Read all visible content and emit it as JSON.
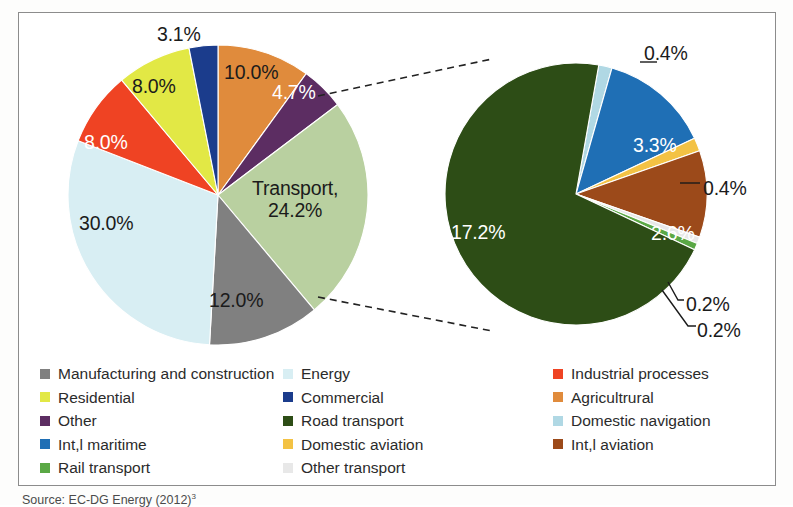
{
  "figure": {
    "source_note": "Source: EC-DG Energy (2012)",
    "source_superscript": "3"
  },
  "colors": {
    "manufacturing": "#808080",
    "energy": "#d8eef3",
    "industrial_processes": "#ef4323",
    "residential": "#e2e845",
    "commercial": "#1b3c8c",
    "agricultrural": "#e08b3c",
    "other": "#5c2d62",
    "road_transport": "#2d4d16",
    "domestic_navigation": "#b0d8e4",
    "intl_maritime": "#1f6fb5",
    "domestic_aviation": "#f3c244",
    "intl_aviation": "#9c4a1a",
    "rail_transport": "#5aa845",
    "other_transport": "#e8e8e8",
    "transport_slice": "#b9d0a0",
    "frame": "#8c8c8c",
    "label_dark": "#1b1b1b",
    "label_light": "#ffffff"
  },
  "chart_data": [
    {
      "type": "pie",
      "name": "total-emissions-pie",
      "title": "",
      "center": [
        218,
        195
      ],
      "radius": 150,
      "start_angle_deg": -90,
      "categories": [
        "Agricultrural",
        "Other",
        "Transport",
        "Manufacturing and construction",
        "Energy",
        "Industrial processes",
        "Residential",
        "Commercial"
      ],
      "values": [
        10.0,
        4.7,
        24.2,
        12.0,
        30.0,
        8.0,
        8.0,
        3.1
      ],
      "labels": [
        "10.0%",
        "4.7%",
        "Transport, 24.2%",
        "12.0%",
        "30.0%",
        "8.0%",
        "8.0%",
        "3.1%"
      ],
      "slice_colors": [
        "#e08b3c",
        "#5c2d62",
        "#b9d0a0",
        "#808080",
        "#d8eef3",
        "#ef4323",
        "#e2e845",
        "#1b3c8c"
      ],
      "label_colors": [
        "#1b1b1b",
        "#ffffff",
        "#1b1b1b",
        "#1b1b1b",
        "#1b1b1b",
        "#ffffff",
        "#1b1b1b",
        "#1b1b1b"
      ]
    },
    {
      "type": "pie",
      "name": "transport-breakdown-pie",
      "title": "",
      "center": [
        576,
        194
      ],
      "radius": 131,
      "start_angle_deg": -80,
      "categories": [
        "Domestic navigation",
        "Int,l maritime",
        "Domestic aviation",
        "Int,l aviation",
        "Other transport",
        "Rail transport",
        "Road transport"
      ],
      "values": [
        0.4,
        3.3,
        0.4,
        2.6,
        0.2,
        0.2,
        17.2
      ],
      "labels": [
        "0.4%",
        "3.3%",
        "0.4%",
        "2.6%",
        "0.2%",
        "0.2%",
        "17.2%"
      ],
      "slice_colors": [
        "#b0d8e4",
        "#1f6fb5",
        "#f3c244",
        "#9c4a1a",
        "#e8e8e8",
        "#5aa845",
        "#2d4d16"
      ],
      "label_colors": [
        "#1b1b1b",
        "#ffffff",
        "#1b1b1b",
        "#ffffff",
        "#1b1b1b",
        "#1b1b1b",
        "#ffffff"
      ]
    }
  ],
  "pie_labels_left": [
    {
      "text": "3.1%",
      "x": 157,
      "y": 24,
      "color": "dark"
    },
    {
      "text": "10.0%",
      "x": 224,
      "y": 62,
      "color": "dark"
    },
    {
      "text": "4.7%",
      "x": 272,
      "y": 82,
      "color": "light"
    },
    {
      "text": "8.0%",
      "x": 132,
      "y": 76,
      "color": "dark"
    },
    {
      "text": "8.0%",
      "x": 84,
      "y": 132,
      "color": "light"
    },
    {
      "text": "30.0%",
      "x": 79,
      "y": 213,
      "color": "dark"
    },
    {
      "text": "12.0%",
      "x": 209,
      "y": 290,
      "color": "dark"
    }
  ],
  "pie_label_transport": {
    "line1": "Transport,",
    "line2": "24.2%",
    "x": 252,
    "y": 178
  },
  "pie_labels_right": [
    {
      "text": "0.4%",
      "x": 644,
      "y": 43,
      "color": "dark"
    },
    {
      "text": "3.3%",
      "x": 633,
      "y": 135,
      "color": "light"
    },
    {
      "text": "0.4%",
      "x": 703,
      "y": 178,
      "color": "dark"
    },
    {
      "text": "2.6%",
      "x": 651,
      "y": 223,
      "color": "light"
    },
    {
      "text": "17.2%",
      "x": 451,
      "y": 222,
      "color": "light"
    },
    {
      "text": "0.2%",
      "x": 686,
      "y": 294,
      "color": "dark"
    },
    {
      "text": "0.2%",
      "x": 697,
      "y": 320,
      "color": "dark"
    }
  ],
  "legend": {
    "rows": [
      {
        "col1": {
          "label": "Manufacturing and construction",
          "color": "#808080"
        },
        "col2": {
          "label": "Energy",
          "color": "#d8eef3"
        },
        "col3": {
          "label": "Industrial processes",
          "color": "#ef4323"
        }
      },
      {
        "col1": {
          "label": "Residential",
          "color": "#e2e845"
        },
        "col2": {
          "label": "Commercial",
          "color": "#1b3c8c"
        },
        "col3": {
          "label": "Agricultrural",
          "color": "#e08b3c"
        }
      },
      {
        "col1": {
          "label": "Other",
          "color": "#5c2d62"
        },
        "col2": {
          "label": "Road transport",
          "color": "#2d4d16"
        },
        "col3": {
          "label": "Domestic navigation",
          "color": "#b0d8e4"
        }
      },
      {
        "col1": {
          "label": "Int,l maritime",
          "color": "#1f6fb5"
        },
        "col2": {
          "label": "Domestic aviation",
          "color": "#f3c244"
        },
        "col3": {
          "label": "Int,l aviation",
          "color": "#9c4a1a"
        }
      },
      {
        "col1": {
          "label": "Rail transport",
          "color": "#5aa845"
        },
        "col2": {
          "label": "Other transport",
          "color": "#e8e8e8"
        },
        "col3": null
      }
    ]
  },
  "connectors": [
    {
      "name": "callout-line-upper",
      "x1": 318,
      "y1": 96,
      "x2": 492,
      "y2": 59
    },
    {
      "name": "callout-line-lower",
      "x1": 318,
      "y1": 297,
      "x2": 492,
      "y2": 331
    }
  ],
  "leader_lines": [
    {
      "name": "leader-domestic-navigation",
      "points": "640,62 657,62"
    },
    {
      "name": "leader-domestic-aviation",
      "points": "680,183 700,183"
    },
    {
      "name": "leader-other-transport",
      "points": "668,282 678,300 684,300"
    },
    {
      "name": "leader-rail-transport",
      "points": "662,290 688,326 696,326"
    }
  ]
}
